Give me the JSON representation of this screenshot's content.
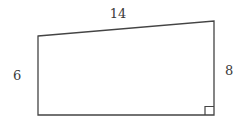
{
  "figure": {
    "kind": "geometry-diagram",
    "shape": "right-trapezoid",
    "background_color": "#ffffff",
    "stroke_color": "#444444",
    "text_color": "#3a3a3a",
    "stroke_width": 1.3,
    "canvas": {
      "width": 244,
      "height": 127
    },
    "vertices": {
      "top_left": {
        "x": 38,
        "y": 36
      },
      "top_right": {
        "x": 214,
        "y": 21
      },
      "bottom_right": {
        "x": 214,
        "y": 115
      },
      "bottom_left": {
        "x": 38,
        "y": 115
      }
    },
    "right_angle_marker": {
      "at": "bottom-right",
      "x": 205,
      "y": 105,
      "size": 9
    },
    "labels": {
      "top_side": "14",
      "left_side": "6",
      "right_side": "8"
    }
  }
}
